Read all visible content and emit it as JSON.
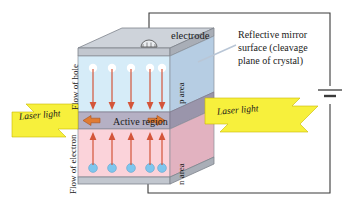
{
  "diagram": {
    "labels": {
      "electrode": "electrode",
      "mirror_line1": "Reflective mirror",
      "mirror_line2": "surface (cleavage",
      "mirror_line3": "plane of crystal)",
      "active_region": "Active region",
      "laser_light_left": "Laser light",
      "laser_light_right": "Laser light",
      "flow_of_hole_line1": "Flow of",
      "flow_of_hole_line2": "hole",
      "flow_of_electron_line1": "Flow of",
      "flow_of_electron_line2": "electron",
      "p_area": "p area",
      "n_area": "n area"
    },
    "colors": {
      "p_area": "#d6ecf8",
      "n_area": "#fbd3da",
      "active_region": "#b5b0c4",
      "electrode_slab": "#c7ccd4",
      "laser_beam": "#f7f03c",
      "carrier_arrow": "#d4553a",
      "active_arrow": "#e07b33",
      "electron_sphere": "#7ec6ee",
      "hole_sphere": "#ffffff",
      "wire": "#3a3a3a",
      "side_face_p": "#9fb6d0",
      "side_face_n": "#e8b9c6"
    },
    "carriers": {
      "hole_count": 5,
      "electron_count": 5,
      "hole_arrow_direction": "down",
      "electron_arrow_direction": "up"
    },
    "circuit": {
      "battery_symbol": "battery",
      "top_wire_from": "electrode",
      "bottom_wire_from": "bottom-electrode"
    }
  }
}
